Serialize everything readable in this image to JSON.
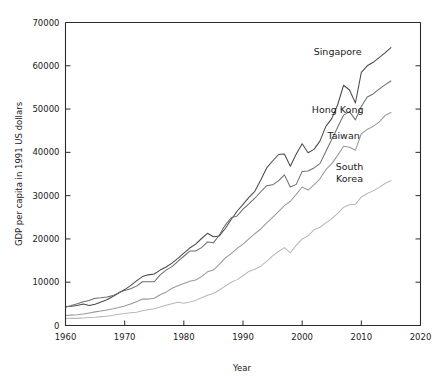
{
  "chart_data": {
    "type": "line",
    "title": "",
    "xlabel": "Year",
    "ylabel": "GDP per capita in 1991 US dollars",
    "xlim": [
      1960,
      2020
    ],
    "ylim": [
      0,
      70000
    ],
    "xticks": [
      1960,
      1970,
      1980,
      1990,
      2000,
      2010,
      2020
    ],
    "yticks": [
      0,
      10000,
      20000,
      30000,
      40000,
      50000,
      60000,
      70000
    ],
    "xtick_labels": [
      "1960",
      "1970",
      "1980",
      "1990",
      "2000",
      "2010",
      "2020"
    ],
    "ytick_labels": [
      "0",
      "10000",
      "20000",
      "30000",
      "40000",
      "50000",
      "60000",
      "70000"
    ],
    "grid": false,
    "legend_position": "inline-right-end-of-line",
    "x": [
      1960,
      1961,
      1962,
      1963,
      1964,
      1965,
      1966,
      1967,
      1968,
      1969,
      1970,
      1971,
      1972,
      1973,
      1974,
      1975,
      1976,
      1977,
      1978,
      1979,
      1980,
      1981,
      1982,
      1983,
      1984,
      1985,
      1986,
      1987,
      1988,
      1989,
      1990,
      1991,
      1992,
      1993,
      1994,
      1995,
      1996,
      1997,
      1998,
      1999,
      2000,
      2001,
      2002,
      2003,
      2004,
      2005,
      2006,
      2007,
      2008,
      2009,
      2010,
      2011,
      2012,
      2013,
      2014,
      2015
    ],
    "series": [
      {
        "name": "Singapore",
        "color": "#4a4a4a",
        "label_x": 2006,
        "label_y": 62500,
        "values": [
          4400,
          4450,
          4600,
          4950,
          4600,
          4900,
          5450,
          5950,
          6700,
          7500,
          8300,
          9200,
          10300,
          11300,
          11700,
          11900,
          12800,
          13500,
          14400,
          15500,
          16700,
          17900,
          18800,
          20100,
          21300,
          20500,
          20700,
          22400,
          24500,
          26400,
          28000,
          29600,
          31000,
          33600,
          36400,
          38000,
          39500,
          39600,
          36800,
          39600,
          42000,
          39900,
          40700,
          42600,
          46000,
          47800,
          51000,
          55500,
          54400,
          51400,
          58500,
          60000,
          60800,
          61900,
          63000,
          64200
        ]
      },
      {
        "name": "Hong Kong",
        "color": "#6e6e6e",
        "label_x": 2006,
        "label_y": 49000,
        "values": [
          4200,
          4600,
          5000,
          5500,
          5800,
          6300,
          6400,
          6600,
          6900,
          7600,
          8100,
          8500,
          9100,
          10100,
          10100,
          10100,
          11700,
          12800,
          13600,
          14800,
          16000,
          17200,
          17200,
          18000,
          19300,
          19100,
          20900,
          23200,
          24900,
          25300,
          26900,
          28100,
          29400,
          30900,
          32300,
          32500,
          33400,
          34800,
          32000,
          32600,
          35600,
          35700,
          36400,
          37400,
          40200,
          43000,
          45800,
          48600,
          49400,
          47500,
          50600,
          52800,
          53500,
          54600,
          55600,
          56500
        ]
      },
      {
        "name": "Taiwan",
        "color": "#9a9a9a",
        "label_x": 2007,
        "label_y": 43200,
        "values": [
          2300,
          2400,
          2500,
          2650,
          2900,
          3150,
          3350,
          3600,
          3850,
          4150,
          4500,
          4950,
          5500,
          6100,
          6100,
          6300,
          7100,
          7700,
          8600,
          9200,
          9700,
          10200,
          10500,
          11300,
          12400,
          12800,
          14100,
          15600,
          16600,
          17800,
          18800,
          20000,
          21200,
          22300,
          23700,
          25000,
          26300,
          27700,
          28700,
          30300,
          32000,
          31300,
          32500,
          33900,
          36000,
          37400,
          39300,
          41400,
          41200,
          40500,
          44300,
          45300,
          46000,
          47000,
          48500,
          49200
        ]
      },
      {
        "name": "South Korea",
        "color": "#b8b8b8",
        "label_x": 2008,
        "label_y": 36000,
        "values": [
          1600,
          1650,
          1650,
          1750,
          1850,
          1900,
          2050,
          2150,
          2350,
          2600,
          2750,
          2950,
          3050,
          3400,
          3650,
          3850,
          4250,
          4650,
          5050,
          5350,
          5150,
          5450,
          5800,
          6400,
          7000,
          7400,
          8200,
          9100,
          10000,
          10600,
          11500,
          12500,
          13000,
          13700,
          14800,
          16100,
          17100,
          18000,
          16800,
          18500,
          20000,
          20700,
          22100,
          22700,
          23700,
          24700,
          25900,
          27300,
          27900,
          28000,
          29700,
          30500,
          31100,
          31900,
          32800,
          33500
        ]
      }
    ]
  },
  "labels": {
    "singapore": "Singapore",
    "hong_kong": "Hong Kong",
    "taiwan": "Taiwan",
    "south_korea_line1": "South",
    "south_korea_line2": "Korea"
  }
}
